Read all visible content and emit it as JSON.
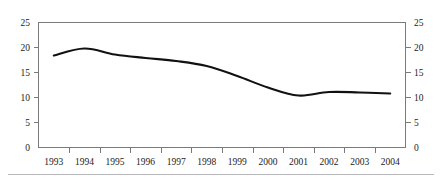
{
  "chart_data": {
    "type": "line",
    "title": "",
    "subtitle": "",
    "xlabel": "",
    "ylabel": "",
    "categories": [
      "1993",
      "1994",
      "1995",
      "1996",
      "1997",
      "1998",
      "1999",
      "2000",
      "2001",
      "2002",
      "2003",
      "2004"
    ],
    "series": [
      {
        "name": "",
        "values": [
          18.4,
          19.8,
          18.6,
          17.9,
          17.3,
          16.3,
          14.3,
          12.0,
          10.4,
          11.1,
          11.0,
          10.8
        ]
      }
    ],
    "ylim": [
      0,
      25
    ],
    "ytick_values": [
      0,
      5,
      10,
      15,
      20,
      25
    ],
    "ytick_labels_left": [
      "0",
      "5",
      "10",
      "15",
      "20",
      "25"
    ],
    "ytick_labels_right": [
      "0",
      "5",
      "10",
      "15",
      "20",
      "25"
    ],
    "dual_y_axis": true,
    "grid": false,
    "legend": false,
    "legend_position": "none",
    "line_color": "#111111",
    "frame_color": "#7a7a7a",
    "rule_color": "#b8b8bd"
  },
  "axes": {
    "y_left": {
      "ticks": [
        {
          "label": "25",
          "value": 25
        },
        {
          "label": "20",
          "value": 20
        },
        {
          "label": "15",
          "value": 15
        },
        {
          "label": "10",
          "value": 10
        },
        {
          "label": "5",
          "value": 5
        },
        {
          "label": "0",
          "value": 0
        }
      ]
    },
    "y_right": {
      "ticks": [
        {
          "label": "25",
          "value": 25
        },
        {
          "label": "20",
          "value": 20
        },
        {
          "label": "15",
          "value": 15
        },
        {
          "label": "10",
          "value": 10
        },
        {
          "label": "5",
          "value": 5
        },
        {
          "label": "0",
          "value": 0
        }
      ]
    },
    "x": {
      "ticks": [
        {
          "label": "1993"
        },
        {
          "label": "1994"
        },
        {
          "label": "1995"
        },
        {
          "label": "1996"
        },
        {
          "label": "1997"
        },
        {
          "label": "1998"
        },
        {
          "label": "1999"
        },
        {
          "label": "2000"
        },
        {
          "label": "2001"
        },
        {
          "label": "2002"
        },
        {
          "label": "2003"
        },
        {
          "label": "2004"
        }
      ]
    }
  }
}
